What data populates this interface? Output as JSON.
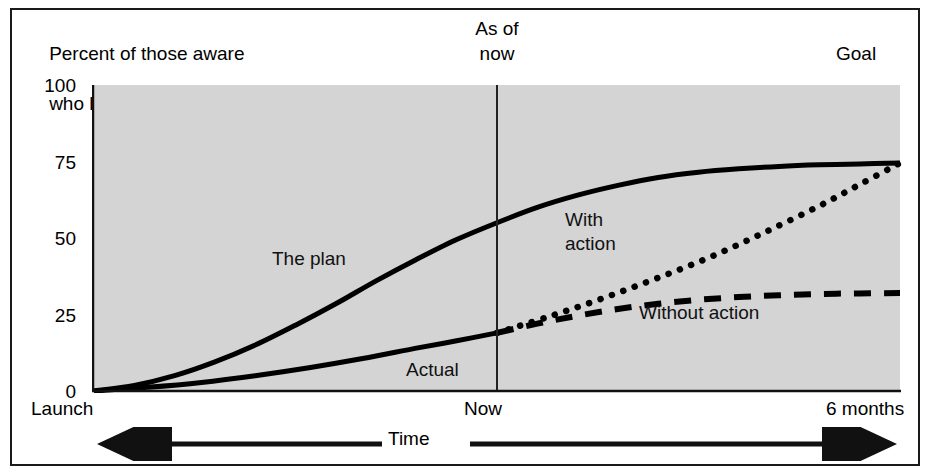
{
  "figure": {
    "ylabel_line1": "Percent of those aware",
    "ylabel_line2_pre": "who have ",
    "ylabel_line2_em": "tried",
    "annotation_asof_line1": "As of",
    "annotation_asof_line2": "now",
    "annotation_goal": "Goal",
    "xaxis_title": "Time",
    "plot_bg": "#d4d4d4",
    "line_color": "#000000"
  },
  "chart_data": {
    "type": "line",
    "title": "",
    "xlabel": "Time",
    "ylabel": "Percent of those aware who have tried",
    "xlim": [
      0,
      6
    ],
    "ylim": [
      0,
      100
    ],
    "grid": false,
    "legend": "inline-annotations",
    "yticks": [
      0,
      25,
      50,
      75,
      100
    ],
    "ytick_labels": [
      "0",
      "25",
      "50",
      "75",
      "100"
    ],
    "xticks": [
      0,
      3,
      6
    ],
    "xtick_labels": [
      "Launch",
      "Now",
      "6 months"
    ],
    "annotations": [
      {
        "text": "As of now",
        "x": 3,
        "position": "above-axis"
      },
      {
        "text": "Goal",
        "x": 6,
        "position": "above-axis-right"
      },
      {
        "text": "The plan",
        "x": 1.35,
        "y": 38
      },
      {
        "text": "With action",
        "x": 3.6,
        "y": 45
      },
      {
        "text": "Without action",
        "x": 4.2,
        "y": 22
      },
      {
        "text": "Actual",
        "x": 2.45,
        "y": 8
      }
    ],
    "vline": {
      "x": 3,
      "label": "Now"
    },
    "series": [
      {
        "name": "The plan",
        "label": "The plan",
        "style": "solid",
        "x": [
          0.0,
          0.3,
          0.6,
          0.9,
          1.2,
          1.5,
          1.8,
          2.1,
          2.4,
          2.7,
          3.0,
          3.3,
          3.6,
          3.9,
          4.2,
          4.5,
          4.8,
          5.1,
          5.4,
          5.7,
          6.0
        ],
        "y": [
          0.0,
          1.8,
          5.0,
          9.5,
          15.0,
          21.5,
          28.5,
          36.0,
          43.0,
          49.5,
          55.0,
          60.0,
          64.0,
          67.2,
          69.8,
          71.5,
          72.6,
          73.4,
          73.9,
          74.2,
          74.5
        ]
      },
      {
        "name": "Actual",
        "label": "Actual",
        "style": "solid",
        "x": [
          0.0,
          0.4,
          0.8,
          1.2,
          1.6,
          2.0,
          2.4,
          2.7,
          3.0
        ],
        "y": [
          0.0,
          1.2,
          2.8,
          5.0,
          7.6,
          10.6,
          14.0,
          16.4,
          19.0
        ]
      },
      {
        "name": "With action",
        "label": "With action",
        "style": "dotted",
        "x": [
          3.0,
          3.4,
          3.8,
          4.2,
          4.6,
          5.0,
          5.4,
          5.7,
          6.0
        ],
        "y": [
          19.0,
          24.5,
          30.5,
          37.0,
          44.0,
          52.0,
          60.5,
          67.5,
          74.5
        ]
      },
      {
        "name": "Without action",
        "label": "Without action",
        "style": "dashed",
        "x": [
          3.0,
          3.3,
          3.6,
          3.9,
          4.2,
          4.5,
          4.8,
          5.1,
          5.4,
          5.7,
          6.0
        ],
        "y": [
          19.0,
          22.0,
          24.6,
          26.8,
          28.5,
          29.8,
          30.7,
          31.3,
          31.7,
          31.9,
          32.0
        ]
      }
    ]
  }
}
